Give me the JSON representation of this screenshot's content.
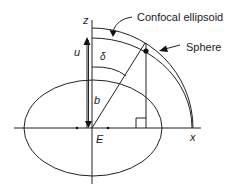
{
  "diagram": {
    "type": "geometry",
    "labels": {
      "z_axis": "z",
      "x_axis": "x",
      "u": "u",
      "delta": "δ",
      "b": "b",
      "E": "E",
      "confocal_ellipsoid": "Confocal ellipsoid",
      "sphere": "Sphere"
    },
    "colors": {
      "line": "#222222",
      "background": "#ffffff"
    }
  }
}
